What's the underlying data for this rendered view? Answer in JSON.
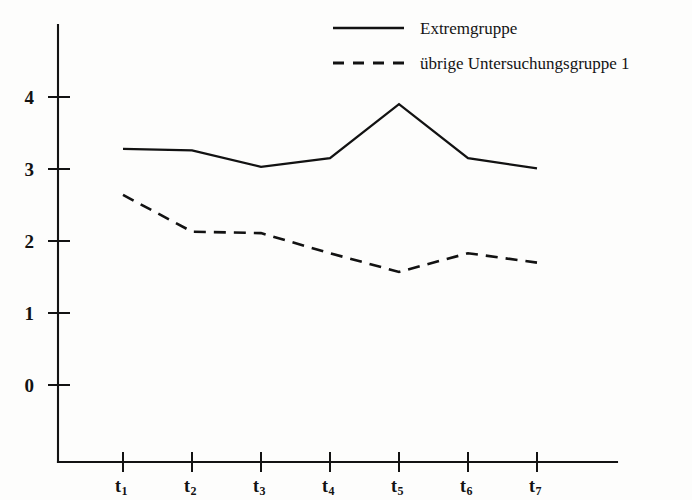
{
  "chart_data": {
    "type": "line",
    "title": "",
    "subtitle": "",
    "xlabel": "",
    "ylabel": "",
    "categories": [
      "t1",
      "t2",
      "t3",
      "t4",
      "t5",
      "t6",
      "t7"
    ],
    "category_labels": [
      {
        "base": "t",
        "sub": "1"
      },
      {
        "base": "t",
        "sub": "2"
      },
      {
        "base": "t",
        "sub": "3"
      },
      {
        "base": "t",
        "sub": "4"
      },
      {
        "base": "t",
        "sub": "5"
      },
      {
        "base": "t",
        "sub": "6"
      },
      {
        "base": "t",
        "sub": "7"
      }
    ],
    "ylim": [
      0,
      4.4
    ],
    "yticks": [
      0,
      1,
      2,
      3,
      4
    ],
    "ytick_labels": [
      "0",
      "1",
      "2",
      "3",
      "4"
    ],
    "grid": false,
    "legend_position": "top-right",
    "series": [
      {
        "name": "Extremgruppe",
        "style": "solid",
        "color": "#121212",
        "values": [
          3.28,
          3.26,
          3.03,
          3.15,
          3.9,
          3.15,
          3.01
        ]
      },
      {
        "name": "übrige Untersuchungsgruppe  1",
        "style": "dashed",
        "color": "#121212",
        "values": [
          2.64,
          2.13,
          2.11,
          1.83,
          1.57,
          1.83,
          1.7
        ]
      }
    ],
    "annotations": []
  },
  "legend": {
    "entries": [
      {
        "label": "Extremgruppe",
        "style": "solid"
      },
      {
        "label": "übrige Untersuchungsgruppe  1",
        "style": "dashed"
      }
    ]
  }
}
